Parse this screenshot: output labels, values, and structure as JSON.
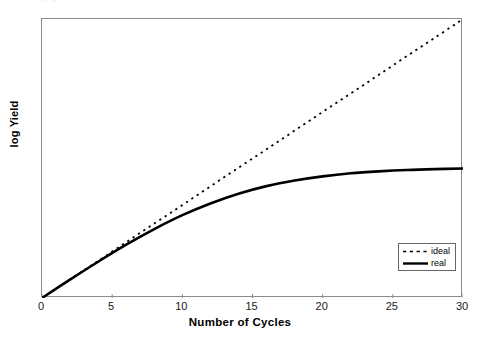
{
  "chart_data": {
    "type": "line",
    "title": "",
    "xlabel": "Number of Cycles",
    "ylabel": "log Yield",
    "xlim": [
      0,
      30
    ],
    "ylim": [
      0,
      1
    ],
    "grid": false,
    "legend_position": "bottom-right",
    "xticks": [
      "0",
      "5",
      "10",
      "15",
      "20",
      "25",
      "30"
    ],
    "xtick_values": [
      0,
      5,
      10,
      15,
      20,
      25,
      30
    ],
    "yticks": [],
    "series": [
      {
        "name": "ideal",
        "style": "dashed",
        "color": "#000000",
        "x": [
          0,
          2,
          4,
          6,
          8,
          10,
          12,
          14,
          16,
          18,
          20,
          22,
          24,
          26,
          28,
          30
        ],
        "values": [
          0.0,
          0.067,
          0.133,
          0.2,
          0.267,
          0.333,
          0.4,
          0.467,
          0.533,
          0.6,
          0.667,
          0.733,
          0.8,
          0.867,
          0.933,
          1.0
        ]
      },
      {
        "name": "real",
        "style": "solid",
        "color": "#000000",
        "x": [
          0,
          2,
          4,
          6,
          8,
          10,
          12,
          14,
          16,
          18,
          20,
          22,
          24,
          26,
          28,
          30
        ],
        "values": [
          0.0,
          0.066,
          0.13,
          0.191,
          0.247,
          0.297,
          0.339,
          0.374,
          0.401,
          0.421,
          0.436,
          0.447,
          0.454,
          0.459,
          0.462,
          0.464
        ]
      }
    ],
    "annotations": {
      "divergence_cycle": 7,
      "real_plateau_value": 0.464
    }
  },
  "legend": {
    "entries": [
      {
        "label": "ideal",
        "style": "dashed"
      },
      {
        "label": "real",
        "style": "solid"
      }
    ]
  },
  "artifact": {
    "top_text": "·                ·"
  }
}
